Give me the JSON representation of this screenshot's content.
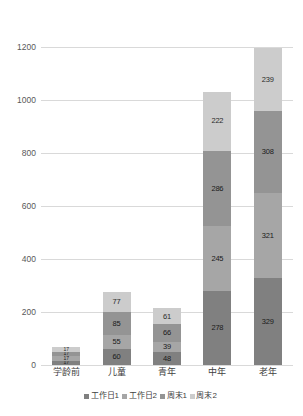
{
  "chart_data": {
    "type": "bar",
    "stacked": true,
    "title": "",
    "xlabel": "",
    "ylabel": "",
    "ylim": [
      0,
      1200
    ],
    "yticks": [
      0,
      200,
      400,
      600,
      800,
      1000,
      1200
    ],
    "grid": true,
    "legend_position": "bottom",
    "categories": [
      "学龄前",
      "儿童",
      "青年",
      "中年",
      "老年"
    ],
    "series": [
      {
        "name": "工作日1",
        "color": "#808080",
        "values": [
          17,
          60,
          48,
          278,
          329
        ]
      },
      {
        "name": "工作日2",
        "color": "#a6a6a6",
        "values": [
          17,
          55,
          39,
          245,
          321
        ]
      },
      {
        "name": "周末1",
        "color": "#949494",
        "values": [
          17,
          85,
          66,
          286,
          308
        ]
      },
      {
        "name": "周末2",
        "color": "#cccccc",
        "values": [
          17,
          77,
          61,
          222,
          239
        ]
      }
    ],
    "totals": [
      68,
      277,
      214,
      1031,
      1197
    ]
  },
  "axis": {
    "ytick_labels": [
      "0",
      "200",
      "400",
      "600",
      "800",
      "1000",
      "1200"
    ]
  },
  "legend": {
    "items": [
      {
        "label": "工作日1",
        "color": "#808080"
      },
      {
        "label": "工作日2",
        "color": "#a6a6a6"
      },
      {
        "label": "周末1",
        "color": "#949494"
      },
      {
        "label": "周末2",
        "color": "#cccccc"
      }
    ]
  }
}
